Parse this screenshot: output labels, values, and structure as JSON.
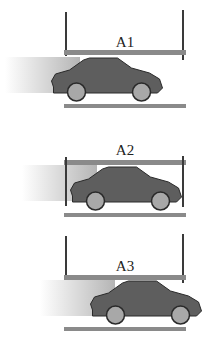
{
  "diagram": {
    "panels": [
      {
        "label": "A1",
        "car_position": "left, partially outside frame"
      },
      {
        "label": "A2",
        "car_position": "fully inside frame"
      },
      {
        "label": "A3",
        "car_position": "right, partially outside frame"
      }
    ],
    "colors": {
      "post": "#3a3a3a",
      "bar": "#8a8a8a",
      "car_body": "#5e5e5e",
      "car_outline": "#2a2a2a",
      "wheel": "#a8a8a8",
      "blur_start": "#ffffff",
      "blur_end": "#b8b8b8"
    }
  }
}
